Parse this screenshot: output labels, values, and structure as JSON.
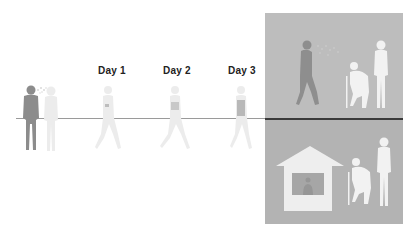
{
  "diagram": {
    "type": "timeline-illustration",
    "day_labels": [
      "Day 1",
      "Day 2",
      "Day 3"
    ],
    "colors": {
      "background": "#ffffff",
      "panel_top": "#bdbdbd",
      "panel_bottom": "#b3b3b3",
      "timeline": "#9a9a9a",
      "timeline_panel": "#3a3a3a",
      "source_person": "#8c8c8c",
      "faded_person": "#ececec",
      "elderly_figures": "#f2f2f2",
      "house": "#eeeeee",
      "house_window": "#a6a6a6"
    },
    "scenes": {
      "start": "infected person coughing near another person",
      "progression": [
        "Day 1 walking figure",
        "Day 2 walking figure",
        "Day 3 walking figure"
      ],
      "panel_top": "walking person spreading to elderly couple outdoors",
      "panel_bottom": "house with person inside, elderly couple protected"
    }
  }
}
